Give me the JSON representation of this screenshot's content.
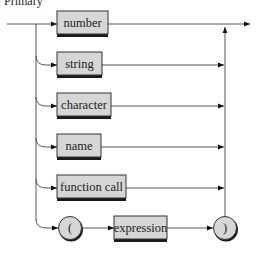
{
  "diagram": {
    "title": "Primary",
    "type": "syntax-diagram",
    "colors": {
      "background": "#ffffff",
      "box_fill": "#d6d6d6",
      "box_border": "#333333",
      "box_shadow": "#1a1a1a",
      "line": "#555555",
      "arrow": "#111111"
    },
    "alternatives": [
      {
        "kind": "box",
        "label": "number"
      },
      {
        "kind": "box",
        "label": "string"
      },
      {
        "kind": "box",
        "label": "character"
      },
      {
        "kind": "box",
        "label": "name"
      },
      {
        "kind": "box",
        "label": "function call"
      },
      {
        "kind": "sequence",
        "items": [
          {
            "kind": "terminal",
            "label": "("
          },
          {
            "kind": "box",
            "label": "expression"
          },
          {
            "kind": "terminal",
            "label": ")"
          }
        ]
      }
    ]
  }
}
